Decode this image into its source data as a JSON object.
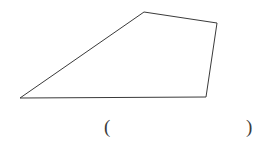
{
  "canvas": {
    "width": 264,
    "height": 146,
    "background_color": "#ffffff"
  },
  "figure": {
    "name": "quadrilateral",
    "shape_type": "quadrilateral",
    "stroke_color": "#3a3a3a",
    "stroke_width": 1,
    "fill": "none",
    "vertices": [
      {
        "label": "bottom-left",
        "x": 20,
        "y": 98
      },
      {
        "label": "top-apex",
        "x": 144,
        "y": 12
      },
      {
        "label": "top-right",
        "x": 217,
        "y": 23
      },
      {
        "label": "bottom-right",
        "x": 206,
        "y": 97
      }
    ],
    "path": "M 20 98 L 144 12 L 217 23 L 206 97 Z"
  },
  "answer_field": {
    "open_paren": "(",
    "close_paren": ")",
    "value": "",
    "placeholder": ""
  }
}
